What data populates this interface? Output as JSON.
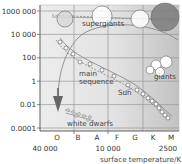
{
  "chart_data": {
    "type": "scatter",
    "title": "",
    "ylabel": "luminosity (relative to Sun)",
    "xlabel": "surface temperature/K",
    "y_scale": "log",
    "y_ticks": [
      "1000 000",
      "10 000",
      "100",
      "1",
      "0.01",
      "0.0001"
    ],
    "y_tick_values": [
      1000000,
      10000,
      100,
      1,
      0.01,
      0.0001
    ],
    "spectral_classes": [
      "O",
      "B",
      "A",
      "F",
      "G",
      "K",
      "M"
    ],
    "x_temperature_labels": [
      "40 000",
      "10 000",
      "2500"
    ],
    "x_temperature_values": [
      40000,
      10000,
      2500
    ],
    "x_reversed": true,
    "regions": [
      {
        "name": "supergiants",
        "label": "supergiants"
      },
      {
        "name": "giants",
        "label": "giants"
      },
      {
        "name": "main-sequence",
        "label": "main\nsequence"
      },
      {
        "name": "white-dwarfs",
        "label": "white dwarfs"
      }
    ],
    "annotations": [
      {
        "name": "sun",
        "label": "Sun"
      }
    ],
    "supergiant_stars": [
      {
        "spectral": "B",
        "log_luminosity": 5.5,
        "relative_size": 0.5,
        "color": "#d6d6d6"
      },
      {
        "spectral": "F",
        "log_luminosity": 5.6,
        "relative_size": 0.7,
        "color": "#ffffff"
      },
      {
        "spectral": "K",
        "log_luminosity": 5.6,
        "relative_size": 0.7,
        "color": "#ffffff"
      },
      {
        "spectral": "M",
        "log_luminosity": 5.6,
        "relative_size": 1.0,
        "color": "#7a7a7a"
      }
    ],
    "grid": true
  },
  "labels": {
    "supergiants": "supergiants",
    "giants": "giants",
    "main1": "main",
    "main2": "sequence",
    "sun": "Sun",
    "white_dwarfs": "white dwarfs",
    "xlabel": "surface temperature/K"
  },
  "colors": {
    "grid": "#9a9a9a",
    "plot_bg": "#f0f0f0",
    "cool_region": "#c8c8c8",
    "axis": "#555555",
    "arrow": "#666666"
  }
}
